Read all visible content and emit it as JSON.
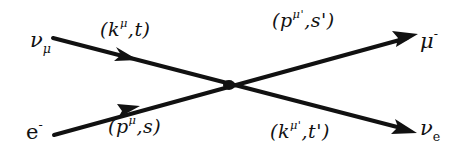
{
  "diagram": {
    "type": "feynman-vertex",
    "colors": {
      "line": "#111111",
      "background": "#ffffff"
    },
    "vertex": {
      "x": 229,
      "y": 85
    },
    "particles": {
      "in_top": {
        "symbol": "ν",
        "subscript": "μ"
      },
      "in_bottom": {
        "symbol": "e",
        "superscript": "-"
      },
      "out_top": {
        "symbol": "μ",
        "superscript": "-"
      },
      "out_bottom": {
        "symbol": "ν",
        "subscript": "e"
      }
    },
    "momenta": {
      "in_top": {
        "open": "(",
        "p": "k",
        "sup": "μ",
        "rest": ",t)"
      },
      "in_bottom": {
        "open": "(",
        "p": "p",
        "sup": "μ",
        "rest": ",s)"
      },
      "out_top": {
        "open": "(",
        "p": "p",
        "sup": "μ'",
        "rest": ",s')"
      },
      "out_bottom": {
        "open": "(",
        "p": "k",
        "sup": "μ'",
        "rest": ",t')"
      }
    }
  }
}
